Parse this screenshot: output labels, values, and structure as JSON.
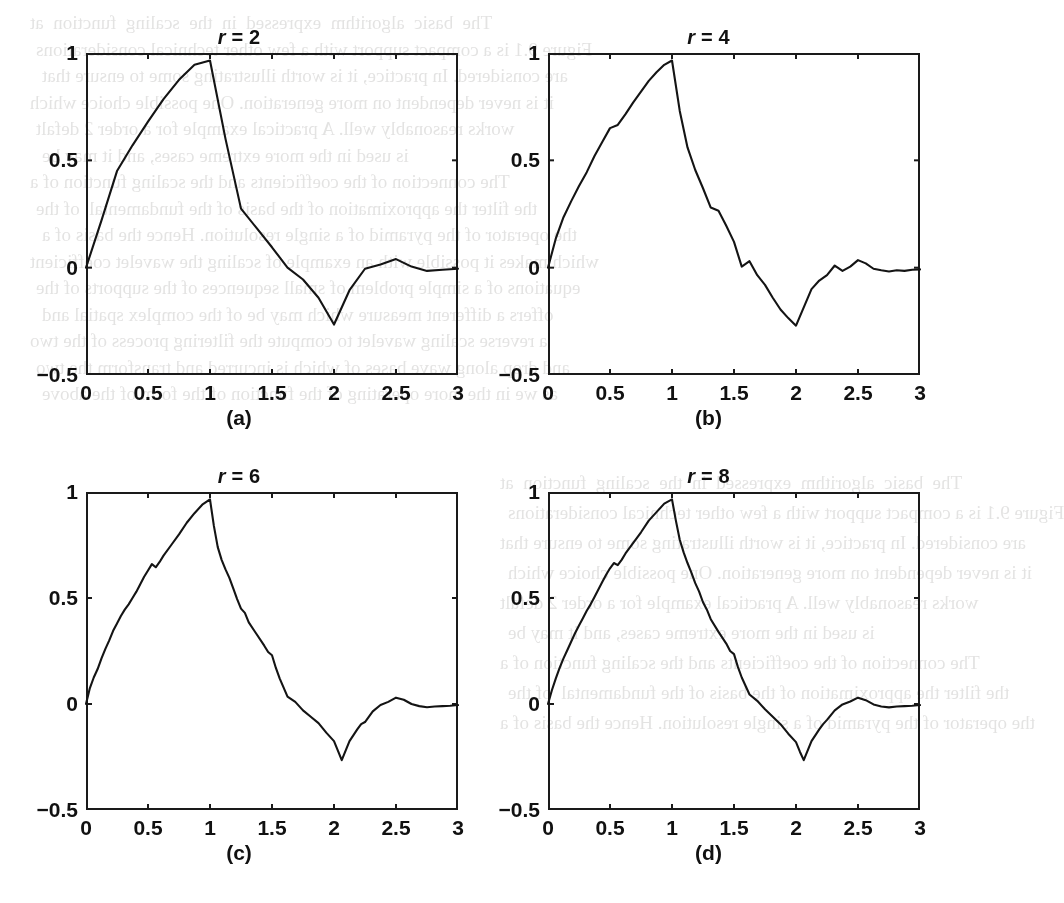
{
  "figure": {
    "background_color": "#ffffff",
    "line_color": "#141414",
    "axis_color": "#1a1a1a",
    "page_ghost_text": [
      "The  basic  algorithm  expressed  in  the  scaling  function  at",
      "Figure 9.1 is a compact support with a few other technical considerations",
      "are considered. In practice, it is worth illustrating some to ensure that",
      "it is never dependent on more generation. One possible choice which",
      "works reasonably well. A practical example for a order 2 defalt",
      "is used in the more extreme cases, and it may be",
      "The connection of the coefficients and the scaling function of a",
      "the filter the approximation of the basis of the fundamental  of the",
      "the operator of the pyramid of a single resolution. Hence the basis of a",
      "which makes it possible with an example of scaling the wavelet coefficient",
      "equations of a simple problem of small sequences of the supports of the",
      "offers a different measure which may be of the complex spatial and",
      "a reverse scaling wavelet to compute the filtering process of the two",
      "and drop along wave bases of which is incurred and transform the two",
      "as we in the more operating of the function of the form of the above"
    ]
  },
  "chart_data": [
    {
      "type": "line",
      "panel_label": "(a)",
      "title": "r = 2",
      "title_var": "r",
      "title_value": "2",
      "xlabel": "",
      "ylabel": "",
      "xlim": [
        0,
        3
      ],
      "ylim": [
        -0.5,
        1
      ],
      "xticks": [
        0,
        0.5,
        1,
        1.5,
        2,
        2.5,
        3
      ],
      "xtick_labels": [
        "0",
        "0.5",
        "1",
        "1.5",
        "2",
        "2.5",
        "3"
      ],
      "yticks": [
        -0.5,
        0,
        0.5,
        1
      ],
      "ytick_labels": [
        "−0.5",
        "0",
        "0.5",
        "1"
      ],
      "grid": false,
      "legend": "none",
      "x": [
        0.0,
        0.125,
        0.25,
        0.375,
        0.5,
        0.625,
        0.75,
        0.875,
        1.0,
        1.125,
        1.25,
        1.375,
        1.5,
        1.625,
        1.75,
        1.875,
        2.0,
        2.125,
        2.25,
        2.375,
        2.5,
        2.625,
        2.75,
        2.875,
        3.0
      ],
      "y": [
        0.0,
        0.22,
        0.45,
        0.57,
        0.68,
        0.785,
        0.875,
        0.945,
        0.965,
        0.6,
        0.275,
        0.185,
        0.095,
        0.0,
        -0.055,
        -0.14,
        -0.265,
        -0.105,
        -0.005,
        0.015,
        0.04,
        0.005,
        -0.015,
        -0.01,
        -0.005
      ]
    },
    {
      "type": "line",
      "panel_label": "(b)",
      "title": "r = 4",
      "title_var": "r",
      "title_value": "4",
      "xlabel": "",
      "ylabel": "",
      "xlim": [
        0,
        3
      ],
      "ylim": [
        -0.5,
        1
      ],
      "xticks": [
        0,
        0.5,
        1,
        1.5,
        2,
        2.5,
        3
      ],
      "xtick_labels": [
        "0",
        "0.5",
        "1",
        "1.5",
        "2",
        "2.5",
        "3"
      ],
      "yticks": [
        -0.5,
        0,
        0.5,
        1
      ],
      "ytick_labels": [
        "−0.5",
        "0",
        "0.5",
        "1"
      ],
      "grid": false,
      "legend": "none",
      "x": [
        0.0,
        0.0625,
        0.125,
        0.1875,
        0.25,
        0.3125,
        0.375,
        0.4375,
        0.5,
        0.5625,
        0.625,
        0.6875,
        0.75,
        0.8125,
        0.875,
        0.9375,
        1.0,
        1.0625,
        1.125,
        1.1875,
        1.25,
        1.3125,
        1.375,
        1.4375,
        1.5,
        1.5625,
        1.625,
        1.6875,
        1.75,
        1.8125,
        1.875,
        1.9375,
        2.0,
        2.0625,
        2.125,
        2.1875,
        2.25,
        2.3125,
        2.375,
        2.4375,
        2.5,
        2.5625,
        2.625,
        2.6875,
        2.75,
        2.8125,
        2.875,
        2.9375,
        3.0
      ],
      "y": [
        0.0,
        0.135,
        0.235,
        0.31,
        0.38,
        0.445,
        0.52,
        0.585,
        0.65,
        0.665,
        0.715,
        0.77,
        0.82,
        0.87,
        0.91,
        0.945,
        0.965,
        0.73,
        0.56,
        0.455,
        0.37,
        0.28,
        0.265,
        0.195,
        0.12,
        0.005,
        0.03,
        -0.035,
        -0.08,
        -0.14,
        -0.195,
        -0.235,
        -0.27,
        -0.185,
        -0.1,
        -0.06,
        -0.035,
        0.01,
        -0.015,
        0.005,
        0.035,
        0.02,
        -0.005,
        -0.012,
        -0.018,
        -0.012,
        -0.015,
        -0.01,
        -0.008
      ]
    },
    {
      "type": "line",
      "panel_label": "(c)",
      "title": "r = 6",
      "title_var": "r",
      "title_value": "6",
      "xlabel": "",
      "ylabel": "",
      "xlim": [
        0,
        3
      ],
      "ylim": [
        -0.5,
        1
      ],
      "xticks": [
        0,
        0.5,
        1,
        1.5,
        2,
        2.5,
        3
      ],
      "xtick_labels": [
        "0",
        "0.5",
        "1",
        "1.5",
        "2",
        "2.5",
        "3"
      ],
      "yticks": [
        -0.5,
        0,
        0.5,
        1
      ],
      "ytick_labels": [
        "−0.5",
        "0",
        "0.5",
        "1"
      ],
      "grid": false,
      "legend": "none",
      "x": [
        0.0,
        0.03125,
        0.0625,
        0.09375,
        0.125,
        0.15625,
        0.1875,
        0.21875,
        0.25,
        0.28125,
        0.3125,
        0.34375,
        0.375,
        0.40625,
        0.4375,
        0.46875,
        0.5,
        0.53125,
        0.5625,
        0.59375,
        0.625,
        0.6875,
        0.75,
        0.8125,
        0.875,
        0.9375,
        1.0,
        1.03125,
        1.0625,
        1.09375,
        1.125,
        1.15625,
        1.1875,
        1.21875,
        1.25,
        1.28125,
        1.3125,
        1.375,
        1.4375,
        1.46875,
        1.5,
        1.53125,
        1.5625,
        1.625,
        1.6875,
        1.75,
        1.8125,
        1.875,
        1.9375,
        2.0,
        2.03125,
        2.0625,
        2.125,
        2.1875,
        2.21875,
        2.25,
        2.3125,
        2.375,
        2.4375,
        2.5,
        2.5625,
        2.625,
        2.6875,
        2.75,
        2.8125,
        2.875,
        2.9375,
        3.0
      ],
      "y": [
        0.0,
        0.075,
        0.125,
        0.165,
        0.215,
        0.26,
        0.3,
        0.345,
        0.38,
        0.415,
        0.445,
        0.47,
        0.5,
        0.53,
        0.565,
        0.6,
        0.63,
        0.66,
        0.645,
        0.67,
        0.7,
        0.75,
        0.8,
        0.855,
        0.9,
        0.94,
        0.965,
        0.84,
        0.74,
        0.68,
        0.635,
        0.595,
        0.545,
        0.495,
        0.45,
        0.43,
        0.385,
        0.33,
        0.275,
        0.245,
        0.23,
        0.17,
        0.12,
        0.035,
        0.01,
        -0.03,
        -0.06,
        -0.09,
        -0.135,
        -0.175,
        -0.22,
        -0.265,
        -0.175,
        -0.12,
        -0.095,
        -0.085,
        -0.035,
        -0.005,
        0.01,
        0.03,
        0.02,
        0.0,
        -0.01,
        -0.015,
        -0.012,
        -0.01,
        -0.008,
        -0.005
      ]
    },
    {
      "type": "line",
      "panel_label": "(d)",
      "title": "r = 8",
      "title_var": "r",
      "title_value": "8",
      "xlabel": "",
      "ylabel": "",
      "xlim": [
        0,
        3
      ],
      "ylim": [
        -0.5,
        1
      ],
      "xticks": [
        0,
        0.5,
        1,
        1.5,
        2,
        2.5,
        3
      ],
      "xtick_labels": [
        "0",
        "0.5",
        "1",
        "1.5",
        "2",
        "2.5",
        "3"
      ],
      "yticks": [
        -0.5,
        0,
        0.5,
        1
      ],
      "ytick_labels": [
        "−0.5",
        "0",
        "0.5",
        "1"
      ],
      "grid": false,
      "legend": "none",
      "x": [
        0.0,
        0.03125,
        0.0625,
        0.09375,
        0.125,
        0.15625,
        0.1875,
        0.21875,
        0.25,
        0.28125,
        0.3125,
        0.34375,
        0.375,
        0.40625,
        0.4375,
        0.46875,
        0.5,
        0.53125,
        0.5625,
        0.59375,
        0.625,
        0.6875,
        0.75,
        0.8125,
        0.875,
        0.9375,
        1.0,
        1.03125,
        1.0625,
        1.09375,
        1.125,
        1.15625,
        1.1875,
        1.21875,
        1.25,
        1.28125,
        1.3125,
        1.375,
        1.4375,
        1.46875,
        1.5,
        1.53125,
        1.5625,
        1.625,
        1.6875,
        1.75,
        1.8125,
        1.875,
        1.9375,
        2.0,
        2.03125,
        2.0625,
        2.125,
        2.1875,
        2.21875,
        2.25,
        2.3125,
        2.375,
        2.4375,
        2.5,
        2.5625,
        2.625,
        2.6875,
        2.75,
        2.8125,
        2.875,
        2.9375,
        3.0
      ],
      "y": [
        0.0,
        0.065,
        0.12,
        0.17,
        0.215,
        0.255,
        0.295,
        0.335,
        0.37,
        0.405,
        0.44,
        0.47,
        0.505,
        0.54,
        0.575,
        0.61,
        0.64,
        0.665,
        0.655,
        0.68,
        0.71,
        0.76,
        0.81,
        0.865,
        0.905,
        0.945,
        0.965,
        0.865,
        0.775,
        0.715,
        0.665,
        0.62,
        0.57,
        0.53,
        0.48,
        0.445,
        0.4,
        0.34,
        0.285,
        0.25,
        0.235,
        0.175,
        0.125,
        0.045,
        0.015,
        -0.025,
        -0.06,
        -0.095,
        -0.14,
        -0.18,
        -0.225,
        -0.265,
        -0.175,
        -0.12,
        -0.095,
        -0.075,
        -0.03,
        -0.002,
        0.012,
        0.03,
        0.018,
        -0.002,
        -0.012,
        -0.016,
        -0.012,
        -0.01,
        -0.008,
        -0.005
      ]
    }
  ]
}
